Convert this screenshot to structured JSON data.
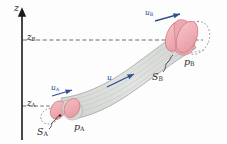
{
  "figure": {
    "type": "physics-diagram",
    "background_color": "#fdfdfd"
  },
  "axis": {
    "name": "vertical-coordinate-axis",
    "label": "z",
    "direction": "up",
    "color": "#1a1a1a"
  },
  "heights": [
    {
      "id": "zA",
      "label": "z",
      "sub": "A",
      "description": "height of lower cross-section A"
    },
    {
      "id": "zB",
      "label": "z",
      "sub": "B",
      "description": "height of upper cross-section B"
    }
  ],
  "velocities": [
    {
      "id": "uA",
      "label": "u",
      "sub": "A",
      "description": "inlet velocity at section A",
      "color": "#2f4f8f"
    },
    {
      "id": "u",
      "label": "u",
      "sub": "",
      "description": "velocity along the stream tube",
      "color": "#2f4f8f"
    },
    {
      "id": "uB",
      "label": "u",
      "sub": "B",
      "description": "outlet velocity at section B",
      "color": "#2f4f8f"
    }
  ],
  "sections": [
    {
      "id": "SA",
      "label": "S",
      "sub": "A",
      "description": "cross-sectional area at A"
    },
    {
      "id": "SB",
      "label": "S",
      "sub": "B",
      "description": "cross-sectional area at B"
    }
  ],
  "pressures": [
    {
      "id": "pA",
      "label": "p",
      "sub": "A",
      "description": "pressure at section A"
    },
    {
      "id": "pB",
      "label": "p",
      "sub": "B",
      "description": "pressure at section B"
    }
  ],
  "colors": {
    "disk_fill": "#eeaab0",
    "disk_edge": "#cf7f88",
    "tube_fill": "#d9dbd8",
    "tube_edge": "#9fa3a0",
    "arrow_blue": "#2f4f8f",
    "dash_gray": "#5a5a5a",
    "axis_black": "#1a1a1a",
    "text": "#2b2b2b"
  }
}
